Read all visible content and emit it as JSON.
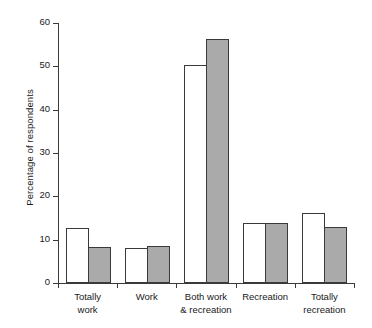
{
  "chart_data": {
    "type": "bar",
    "title": "",
    "xlabel": "",
    "ylabel": "Percentage of respondents",
    "ylim": [
      0,
      60
    ],
    "yticks": [
      0,
      10,
      20,
      30,
      40,
      50,
      60
    ],
    "grid": false,
    "legend": "none",
    "categories": [
      "Totally\nwork",
      "Work",
      "Both work\n& recreation",
      "Recreation",
      "Totally\nrecreation"
    ],
    "series": [
      {
        "name": "Series 1",
        "style": "white-filled-bar",
        "color": "#ffffff",
        "values": [
          12.5,
          7.9,
          50.0,
          13.7,
          16.0
        ]
      },
      {
        "name": "Series 2",
        "style": "grey-filled-bar",
        "color": "#aaaaaa",
        "values": [
          8.1,
          8.4,
          56.0,
          13.6,
          12.7
        ]
      }
    ]
  },
  "axis": {
    "tick_labels": [
      "0",
      "10",
      "20",
      "30",
      "40",
      "50",
      "60"
    ],
    "ylabel": "Percentage of respondents"
  },
  "categories": [
    {
      "line1": "Totally",
      "line2": "work"
    },
    {
      "line1": "Work",
      "line2": ""
    },
    {
      "line1": "Both work",
      "line2": "& recreation"
    },
    {
      "line1": "Recreation",
      "line2": ""
    },
    {
      "line1": "Totally",
      "line2": "recreation"
    }
  ],
  "colors": {
    "axis": "#3a3a3a",
    "bar_outline": "#3a3a3a",
    "bar_fill_white": "#ffffff",
    "bar_fill_grey": "#aaaaaa",
    "background": "#ffffff"
  }
}
